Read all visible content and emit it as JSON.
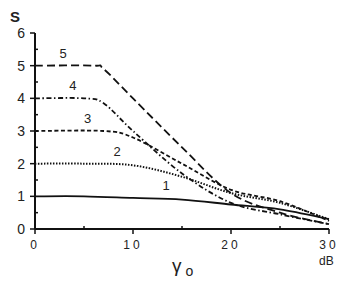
{
  "chart_data": {
    "type": "line",
    "title": "",
    "xlabel": "γ o",
    "xunit": "dB",
    "ylabel": "S",
    "xlim": [
      0,
      30
    ],
    "ylim": [
      0,
      6
    ],
    "xticks": [
      0,
      10,
      20,
      30
    ],
    "yticks": [
      0,
      1,
      2,
      3,
      4,
      5,
      6
    ],
    "grid": false,
    "legend": "inline numeric labels on curves",
    "series": [
      {
        "name": "1",
        "style": "solid",
        "x": [
          0,
          5,
          10,
          15,
          20,
          25,
          30
        ],
        "y": [
          1.0,
          1.0,
          0.95,
          0.9,
          0.75,
          0.6,
          0.3
        ],
        "label_pos": [
          13,
          1.2
        ]
      },
      {
        "name": "2",
        "style": "dotted",
        "x": [
          0,
          5,
          10,
          15,
          20,
          25,
          30
        ],
        "y": [
          2.0,
          2.0,
          1.95,
          1.6,
          1.1,
          0.8,
          0.3
        ],
        "label_pos": [
          8,
          2.25
        ]
      },
      {
        "name": "3",
        "style": "short-dash",
        "x": [
          0,
          7,
          10,
          15,
          20,
          25,
          30
        ],
        "y": [
          3.0,
          3.0,
          2.8,
          2.0,
          1.2,
          0.85,
          0.25
        ],
        "label_pos": [
          5,
          3.25
        ]
      },
      {
        "name": "4",
        "style": "dash-dot",
        "x": [
          0,
          5,
          7,
          10,
          15,
          20,
          25,
          30
        ],
        "y": [
          4.0,
          4.0,
          3.85,
          3.0,
          1.7,
          0.8,
          0.45,
          0.15
        ],
        "label_pos": [
          3.5,
          4.25
        ]
      },
      {
        "name": "5",
        "style": "long-dash",
        "x": [
          0,
          6,
          7,
          10,
          15,
          20,
          25,
          30
        ],
        "y": [
          5.0,
          5.0,
          4.9,
          4.0,
          2.5,
          1.1,
          0.5,
          0.15
        ],
        "label_pos": [
          2.5,
          5.25
        ]
      }
    ]
  },
  "axis": {
    "y_title": "S",
    "x_title_main": "γ",
    "x_title_sub": "o",
    "x_unit": "dB"
  }
}
